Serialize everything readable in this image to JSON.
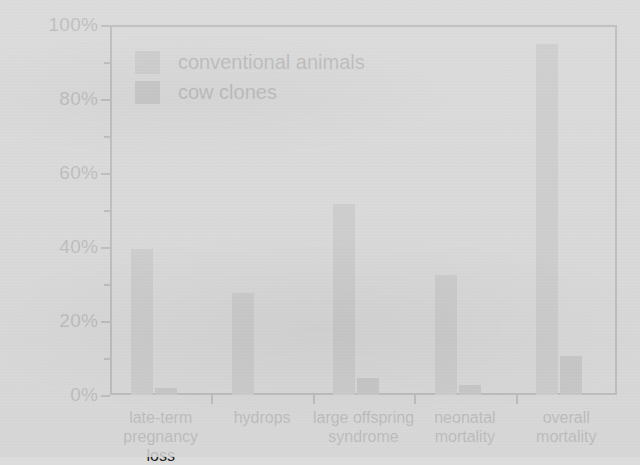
{
  "chart_data": {
    "type": "bar",
    "title": "",
    "xlabel": "",
    "ylabel": "frequency of occurence",
    "ylim": [
      0,
      100
    ],
    "y_unit": "%",
    "grid": false,
    "legend_position": "top-left",
    "y_ticks": [
      "0%",
      "20%",
      "40%",
      "60%",
      "80%",
      "100%"
    ],
    "y_tick_values": [
      0,
      20,
      40,
      60,
      80,
      100
    ],
    "y_minor_tick_values": [
      10,
      30,
      50,
      70,
      90
    ],
    "categories": [
      {
        "lines": [
          "late-term",
          "pregnancy loss"
        ]
      },
      {
        "lines": [
          "hydrops"
        ]
      },
      {
        "lines": [
          "large offspring",
          "syndrome"
        ]
      },
      {
        "lines": [
          "neonatal",
          "mortality"
        ]
      },
      {
        "lines": [
          "overall mortality"
        ]
      }
    ],
    "category_labels": [
      "late-term pregnancy loss",
      "hydrops",
      "large offspring syndrome",
      "neonatal mortality",
      "overall mortality"
    ],
    "series": [
      {
        "name": "conventional animals",
        "color": "#8f8f8f",
        "values": [
          39.5,
          27.5,
          51.5,
          32.5,
          95.0
        ]
      },
      {
        "name": "cow clones",
        "color": "#6e6e6e",
        "values": [
          2.0,
          0.0,
          4.7,
          2.8,
          10.5
        ]
      }
    ],
    "legend": [
      {
        "label": "conventional animals",
        "color": "#8f8f8f"
      },
      {
        "label": "cow clones",
        "color": "#6e6e6e"
      }
    ],
    "axis_color": "#2b2b2b",
    "background_color": "#dcdcdc"
  }
}
